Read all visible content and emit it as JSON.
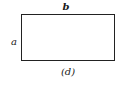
{
  "diagram": {
    "shape": "rectangle",
    "labels": {
      "top": "b",
      "left": "a"
    },
    "caption": "(d)",
    "stroke_color": "#222222",
    "fill_color": "#ffffff"
  }
}
